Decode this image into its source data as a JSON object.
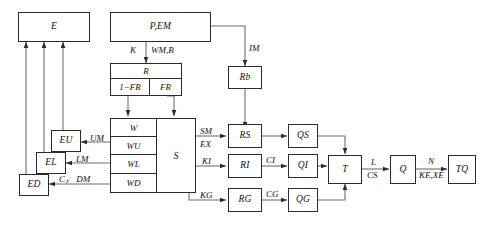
{
  "diagram": {
    "stroke_color": "#2b2b2b",
    "background_color": "#ffffff",
    "width": 484,
    "height": 236
  },
  "boxes": {
    "e": "E",
    "p_em": "P,EM",
    "r": "R",
    "r_left": "1−FR",
    "r_right": "FR",
    "rb": "Rb",
    "eu": "EU",
    "el": "EL",
    "ed": "ED",
    "w": "W",
    "wu": "WU",
    "wl": "WL",
    "wd": "WD",
    "s": "S",
    "rs": "RS",
    "ri": "RI",
    "rg": "RG",
    "qs": "QS",
    "qi": "QI",
    "qg": "QG",
    "t": "T",
    "q": "Q",
    "tq": "TQ"
  },
  "flow_labels": {
    "k": "K",
    "wm_b": "WM,B",
    "im": "IM",
    "um": "UM",
    "lm": "LM",
    "c_dm": "C， DM",
    "sm": "SM",
    "ex": "EX",
    "ki": "KI",
    "kg": "KG",
    "ci": "CI",
    "cg": "CG",
    "l": "L",
    "cs": "CS",
    "n": "N",
    "ke_xe": "KE,XE"
  },
  "icons": {
    "arrowhead": "arrowhead-icon"
  }
}
